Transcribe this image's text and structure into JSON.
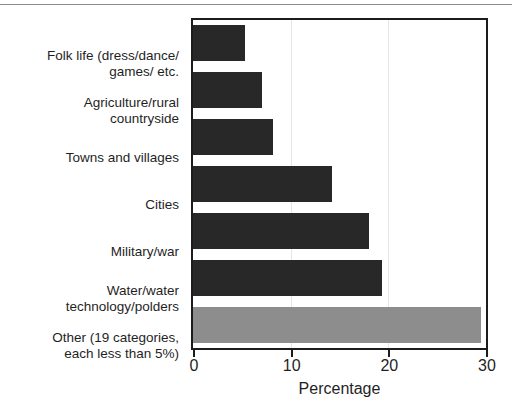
{
  "chart_data": {
    "type": "bar",
    "orientation": "horizontal",
    "title": "",
    "xlabel": "Percentage",
    "ylabel": "",
    "xlim": [
      0,
      30
    ],
    "xticks": [
      0,
      10,
      20,
      30
    ],
    "xtick_labels": [
      "0",
      "10",
      "20",
      "30"
    ],
    "grid": "vertical-light",
    "legend": "none",
    "categories": [
      "Folk life (dress/dance/ games/ etc.",
      "Agriculture/rural countryside",
      "Towns and villages",
      "Cities",
      "Military/war",
      "Water/water technology/polders",
      "Other (19 categories, each less than 5%)"
    ],
    "category_lines": [
      [
        "Folk life (dress/dance/",
        "games/ etc."
      ],
      [
        "Agriculture/rural",
        "countryside"
      ],
      [
        "Towns and villages"
      ],
      [
        "Cities"
      ],
      [
        "Military/war"
      ],
      [
        "Water/water",
        "technology/polders"
      ],
      [
        "Other (19 categories,",
        "each less than 5%)"
      ]
    ],
    "values": [
      5.3,
      7.1,
      8.2,
      14.2,
      18.0,
      19.4,
      29.5
    ],
    "bar_colors": [
      "#282828",
      "#282828",
      "#282828",
      "#282828",
      "#282828",
      "#282828",
      "#8d8d8d"
    ],
    "colors": {
      "bar_dark": "#282828",
      "bar_other_gray": "#8d8d8d",
      "axis": "#1c1c1c",
      "gridline": "#e6e6e6",
      "text": "#1f1f1f",
      "background": "#ffffff"
    }
  }
}
